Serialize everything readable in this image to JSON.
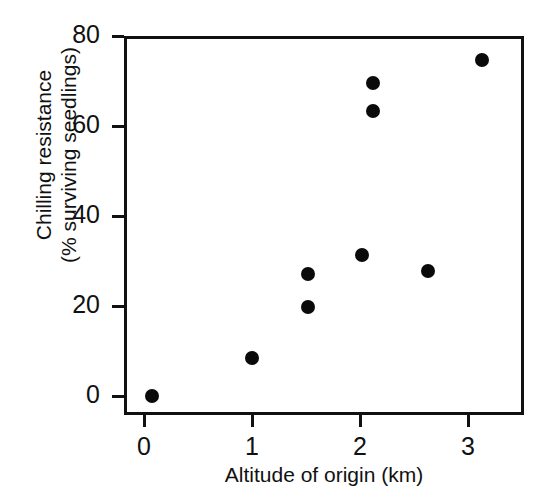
{
  "chart_data": {
    "type": "scatter",
    "title": "",
    "xlabel": "Altitude of origin (km)",
    "ylabel_line1": "Chilling resistance",
    "ylabel_line2": "(% surviving seedlings)",
    "xlim": [
      -0.19,
      3.52
    ],
    "ylim": [
      -4.2,
      80
    ],
    "xticks": [
      0,
      1,
      2,
      3
    ],
    "xtick_labels": [
      "0",
      "1",
      "2",
      "3"
    ],
    "yticks": [
      0,
      20,
      40,
      60,
      80
    ],
    "ytick_labels": [
      "0",
      "20",
      "40",
      "60",
      "80"
    ],
    "grid": false,
    "legend": null,
    "marker": "filled-circle",
    "marker_color": "#0a0a0a",
    "series": [
      {
        "name": "seedling populations",
        "points": [
          {
            "x": 0.07,
            "y": 0.0
          },
          {
            "x": 1.0,
            "y": 8.4
          },
          {
            "x": 1.52,
            "y": 27.1
          },
          {
            "x": 1.52,
            "y": 19.8
          },
          {
            "x": 2.02,
            "y": 31.3
          },
          {
            "x": 2.12,
            "y": 69.6
          },
          {
            "x": 2.12,
            "y": 63.3
          },
          {
            "x": 2.63,
            "y": 27.8
          },
          {
            "x": 3.13,
            "y": 74.7
          }
        ]
      }
    ]
  },
  "figure": {
    "background_color": "#ffffff",
    "axis_color": "#111111"
  }
}
